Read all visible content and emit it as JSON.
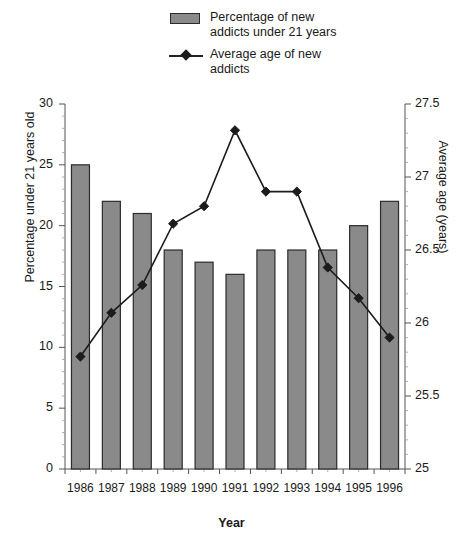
{
  "chart_data": {
    "type": "bar",
    "title": "",
    "categories": [
      "1986",
      "1987",
      "1988",
      "1989",
      "1990",
      "1991",
      "1992",
      "1993",
      "1994",
      "1995",
      "1996"
    ],
    "xlabel": "Year",
    "grid": false,
    "legend_position": "top-center",
    "series": [
      {
        "name": "Percentage of new addicts under 21 years",
        "type": "bar",
        "axis": "left",
        "color": "#8a8a8a",
        "edge_color": "#2b2b2b",
        "values": [
          25,
          22,
          21,
          18,
          17,
          16,
          18,
          18,
          18,
          20,
          22
        ]
      },
      {
        "name": "Average age of new addicts",
        "type": "line",
        "axis": "right",
        "color": "#1c1c1c",
        "marker": "diamond",
        "values": [
          25.77,
          26.07,
          26.26,
          26.68,
          26.8,
          27.32,
          26.9,
          26.9,
          26.38,
          26.17,
          25.9
        ]
      }
    ],
    "yaxis_left": {
      "label": "Percentage under 21 years old",
      "ylim": [
        0,
        30
      ],
      "ticks": [
        0,
        5,
        10,
        15,
        20,
        25,
        30
      ],
      "tick_labels": [
        "0",
        "5",
        "10",
        "15",
        "20",
        "25",
        "30"
      ]
    },
    "yaxis_right": {
      "label": "Average age (years)",
      "ylim": [
        25,
        27.5
      ],
      "ticks": [
        25,
        25.5,
        26,
        26.5,
        27,
        27.5
      ],
      "tick_labels": [
        "25",
        "25.5",
        "26",
        "26.5",
        "27",
        "27.5"
      ]
    }
  },
  "legend": {
    "items": [
      {
        "label_line1": "Percentage of new",
        "label_line2": "addicts under 21 years",
        "key": "bar-swatch"
      },
      {
        "label_line1": "Average age of new",
        "label_line2": "addicts",
        "key": "line-marker"
      }
    ]
  },
  "axis_titles": {
    "left": "Percentage under 21 years old",
    "right": "Average age (years)",
    "bottom": "Year"
  },
  "colors": {
    "bar_fill": "#8a8a8a",
    "bar_edge": "#2b2b2b",
    "line": "#1c1c1c",
    "axis": "#555555",
    "text": "#1a1a1a",
    "background": "#ffffff"
  }
}
